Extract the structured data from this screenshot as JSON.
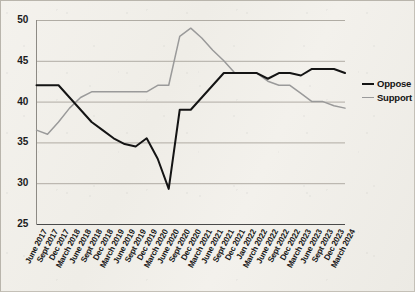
{
  "chart_data": {
    "type": "line",
    "title": "",
    "subtitle": "",
    "xlabel": "",
    "ylabel": "",
    "ylim": [
      25,
      50
    ],
    "yticks": [
      25,
      30,
      35,
      40,
      45,
      50
    ],
    "grid": "horizontal",
    "legend_position": "right",
    "categories": [
      "June 2017",
      "Sept 2017",
      "Dec 2017",
      "March 2018",
      "June 2018",
      "Sept 2018",
      "Dec 2018",
      "March 2019",
      "June 2019",
      "Sept 2019",
      "Dec 2019",
      "March 2020",
      "June 2020",
      "Sept 2020",
      "Dec 2020",
      "March 2021",
      "June 2021",
      "Sept 2021",
      "Dec 2021",
      "Jan 2022",
      "March 2022",
      "June 2022",
      "Sept 2022",
      "Dec 2022",
      "March 2023",
      "June 2023",
      "Sept 2023",
      "Dec 2023",
      "March 2024"
    ],
    "series": [
      {
        "name": "Oppose",
        "color": "#141414",
        "values": [
          42,
          42,
          42,
          40.5,
          39,
          37.5,
          36.5,
          35.5,
          34.8,
          34.5,
          35.5,
          33,
          29.3,
          39,
          39,
          40.5,
          42,
          43.5,
          43.5,
          43.5,
          43.5,
          42.8,
          43.5,
          43.5,
          43.2,
          44,
          44,
          44,
          43.5
        ]
      },
      {
        "name": "Support",
        "color": "#9a9a9a",
        "values": [
          36.5,
          36,
          37.5,
          39.2,
          40.5,
          41.2,
          41.2,
          41.2,
          41.2,
          41.2,
          41.2,
          42,
          42,
          48,
          49,
          47.8,
          46.3,
          45,
          43.5,
          43.5,
          43.5,
          42.5,
          42,
          42,
          41,
          40,
          40,
          39.5,
          39.2
        ]
      }
    ]
  },
  "legend": {
    "items": [
      {
        "label": "Oppose",
        "color": "#141414"
      },
      {
        "label": "Support",
        "color": "#9a9a9a"
      }
    ]
  }
}
